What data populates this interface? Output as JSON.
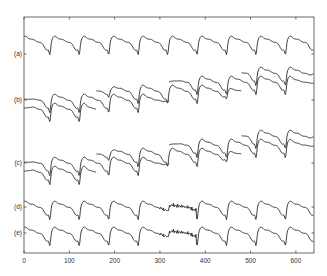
{
  "chart_data": {
    "type": "line",
    "title": "",
    "xlabel": "",
    "ylabel": "",
    "xlim": [
      0,
      640
    ],
    "xticks": [
      0,
      100,
      200,
      300,
      400,
      500,
      600
    ],
    "grid": false,
    "legend": null,
    "row_labels": [
      "(a)",
      "(b)",
      "(c)",
      "(d)",
      "(e)"
    ],
    "series": [
      {
        "name": "(a)",
        "segments": [
          {
            "x_start": 0,
            "x_end": 640,
            "baseline": 0
          }
        ]
      },
      {
        "name": "(b)",
        "segments": [
          {
            "x_start": 0,
            "x_end": 160,
            "baseline": -1
          },
          {
            "x_start": 0,
            "x_end": 320,
            "baseline": 0
          },
          {
            "x_start": 160,
            "x_end": 480,
            "baseline": 1
          },
          {
            "x_start": 320,
            "x_end": 640,
            "baseline": 2
          },
          {
            "x_start": 480,
            "x_end": 640,
            "baseline": 3
          }
        ]
      },
      {
        "name": "(c)",
        "segments": [
          {
            "x_start": 0,
            "x_end": 160,
            "baseline": -1
          },
          {
            "x_start": 0,
            "x_end": 320,
            "baseline": 0
          },
          {
            "x_start": 160,
            "x_end": 480,
            "baseline": 1
          },
          {
            "x_start": 320,
            "x_end": 640,
            "baseline": 2
          },
          {
            "x_start": 480,
            "x_end": 640,
            "baseline": 3
          }
        ]
      },
      {
        "name": "(d)",
        "segments": [
          {
            "x_start": 0,
            "x_end": 640,
            "baseline": 0,
            "noisy_region": [
              300,
              380
            ]
          }
        ]
      },
      {
        "name": "(e)",
        "segments": [
          {
            "x_start": 0,
            "x_end": 640,
            "baseline": 0,
            "noisy_region": [
              300,
              380
            ]
          }
        ]
      }
    ]
  },
  "layout": {
    "plot_left": 24,
    "plot_right": 314,
    "plot_top": 17,
    "plot_bottom": 253,
    "row_y": [
      42,
      100,
      163,
      207,
      233
    ]
  }
}
